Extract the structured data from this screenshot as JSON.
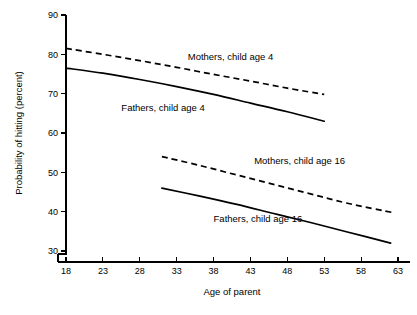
{
  "chart_data": {
    "type": "line",
    "title": "",
    "xlabel": "Age of parent",
    "ylabel": "Probability of hitting (percent)",
    "xlim": [
      18,
      63
    ],
    "ylim": [
      30,
      90
    ],
    "xticks": [
      18,
      23,
      28,
      33,
      38,
      43,
      48,
      53,
      58,
      63
    ],
    "xtick_labels": [
      "18",
      "23",
      "28",
      "33",
      "38",
      "43",
      "48",
      "53",
      "58",
      "63"
    ],
    "yticks": [
      30,
      40,
      50,
      60,
      70,
      80,
      90
    ],
    "ytick_labels": [
      "30",
      "40",
      "50",
      "60",
      "70",
      "80",
      "90"
    ],
    "grid": false,
    "legend_position": "inline-annotations",
    "series": [
      {
        "name": "Mothers, child age 4",
        "style": "dashed",
        "label_x": 34.5,
        "label_y": 78.5,
        "x": [
          18,
          23,
          28,
          33,
          38,
          43,
          48,
          53
        ],
        "values": [
          81.5,
          80.0,
          78.4,
          76.7,
          74.9,
          73.2,
          71.4,
          69.8
        ]
      },
      {
        "name": "Fathers, child age 4",
        "style": "solid",
        "label_x": 25.5,
        "label_y": 65.5,
        "x": [
          18,
          23,
          28,
          33,
          38,
          43,
          48,
          53
        ],
        "values": [
          76.5,
          75.2,
          73.6,
          71.8,
          69.8,
          67.6,
          65.4,
          63.0
        ]
      },
      {
        "name": "Mothers, child age 16",
        "style": "dashed",
        "label_x": 43.5,
        "label_y": 52.0,
        "x": [
          31,
          36,
          41,
          46,
          51,
          56,
          62.5
        ],
        "values": [
          54.0,
          51.8,
          49.4,
          47.0,
          44.6,
          42.2,
          39.7
        ]
      },
      {
        "name": "Fathers, child age 16",
        "style": "solid",
        "label_x": 38.0,
        "label_y": 37.5,
        "x": [
          31,
          36,
          41,
          46,
          51,
          56,
          62
        ],
        "values": [
          46.0,
          44.0,
          41.9,
          39.6,
          37.3,
          34.9,
          32.0
        ]
      }
    ]
  },
  "axes": {
    "x_title": "Age of parent",
    "y_title": "Probability of hitting (percent)"
  },
  "colors": {
    "ink": "#000000",
    "background": "#ffffff"
  }
}
